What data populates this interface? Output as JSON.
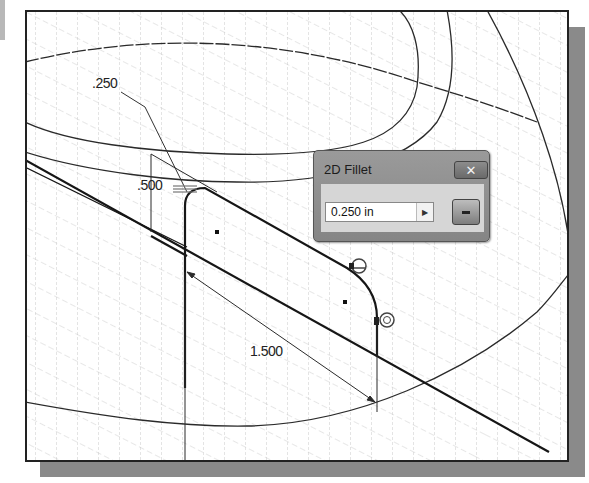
{
  "window": {
    "type": "cad-sketch-viewport"
  },
  "dimensions": {
    "radius_label": ".250",
    "height_label": ".500",
    "length_label": "1.500"
  },
  "dialog": {
    "title": "2D Fillet",
    "value": "0.250 in",
    "arrow_icon": "▶",
    "close_icon": "✕",
    "apply_icon": "equal-icon"
  },
  "constraints": {
    "tangent_icons": [
      "tangent-constraint-icon",
      "tangent-constraint-icon",
      "tangent-constraint-icon"
    ]
  },
  "colors": {
    "geometry": "#1a1a1a",
    "grid": "#b5b5b5",
    "dialog_bg": "#8f8f8f",
    "dialog_body": "#d6d6d6",
    "shadow": "#8a8a8a"
  }
}
